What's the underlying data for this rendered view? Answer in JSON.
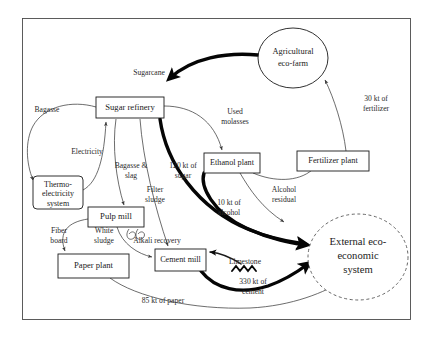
{
  "figure": {
    "type": "process-flow-diagram",
    "frame": {
      "x": 22,
      "y": 18,
      "width": 389,
      "height": 302
    }
  },
  "colors": {
    "background": "#ffffff",
    "node_stroke": "#1a1a1a",
    "thin_flow": "#3c3c3c",
    "thick_flow": "#050505",
    "dashed_stroke": "#555555",
    "text": "#1a1a1a"
  },
  "nodes": [
    {
      "id": "sugar-refinery",
      "label": "Sugar refinery",
      "shape": "rect",
      "x": 96,
      "y": 97,
      "width": 68,
      "height": 21,
      "font_size": 8.6
    },
    {
      "id": "agricultural-eco-farm",
      "label_lines": [
        "Agricultural",
        "eco-farm"
      ],
      "shape": "ellipse",
      "cx": 293,
      "cy": 58,
      "rx": 35,
      "ry": 30,
      "font_size": 8.4
    },
    {
      "id": "ethanol-plant",
      "label": "Ethanol plant",
      "shape": "rect",
      "x": 204,
      "y": 153,
      "width": 56,
      "height": 20,
      "font_size": 8.2
    },
    {
      "id": "fertilizer-plant",
      "label": "Fertilizer plant",
      "shape": "rect",
      "x": 297,
      "y": 151,
      "width": 72,
      "height": 20,
      "font_size": 8.4
    },
    {
      "id": "thermo-electricity-system",
      "label_lines": [
        "Thermo-",
        "electricity",
        "system"
      ],
      "shape": "rounded-rect",
      "x": 33,
      "y": 176,
      "width": 50,
      "height": 33,
      "font_size": 8.0
    },
    {
      "id": "pulp-mill",
      "label": "Pulp mill",
      "shape": "rect",
      "x": 88,
      "y": 207,
      "width": 56,
      "height": 20,
      "font_size": 8.6
    },
    {
      "id": "paper-plant",
      "label": "Paper plant",
      "shape": "rect",
      "x": 58,
      "y": 254,
      "width": 71,
      "height": 24,
      "font_size": 8.6
    },
    {
      "id": "cement-mill",
      "label": "Cement mill",
      "shape": "rect",
      "x": 155,
      "y": 249,
      "width": 51,
      "height": 22,
      "font_size": 8.2
    },
    {
      "id": "external-eco-economic-system",
      "label_lines": [
        "External eco-",
        "economic",
        "system"
      ],
      "shape": "ellipse-dashed",
      "cx": 358,
      "cy": 257,
      "rx": 50,
      "ry": 43,
      "font_size": 10.6
    }
  ],
  "flows": [
    {
      "id": "sugarcane",
      "label": "Sugarcane",
      "from": "agricultural-eco-farm",
      "to": "sugar-refinery",
      "weight": "thick",
      "label_x": 149,
      "label_y": 73
    },
    {
      "id": "bagasse",
      "label": "Bagasse",
      "from": "sugar-refinery",
      "to": "thermo-electricity-system",
      "weight": "thin",
      "label_x": 47,
      "label_y": 110
    },
    {
      "id": "electricity",
      "label": "Electricity",
      "from": "thermo-electricity-system",
      "to": "sugar-refinery",
      "weight": "thin",
      "label_x": 87,
      "label_y": 152
    },
    {
      "id": "bagasse-slag",
      "label_lines": [
        "Bagasse &",
        "slag"
      ],
      "from": "sugar-refinery",
      "to": "pulp-mill",
      "weight": "thin",
      "label_x": 131,
      "label_y": 170
    },
    {
      "id": "used-molasses",
      "label_lines": [
        "Used",
        "molasses"
      ],
      "from": "sugar-refinery",
      "to": "ethanol-plant",
      "weight": "thin",
      "label_x": 235,
      "label_y": 117
    },
    {
      "id": "sugar-output",
      "label_lines": [
        "120 kt of",
        "sugar"
      ],
      "from": "sugar-refinery",
      "to": "external-eco-economic-system",
      "weight": "thick",
      "label_x": 183,
      "label_y": 170
    },
    {
      "id": "filter-sludge",
      "label_lines": [
        "Filter",
        "sludge"
      ],
      "from": "sugar-refinery",
      "to": "cement-mill",
      "weight": "thin",
      "label_x": 155,
      "label_y": 194
    },
    {
      "id": "alcohol-output",
      "label_lines": [
        "10 kt of",
        "alcohol"
      ],
      "from": "ethanol-plant",
      "to": "external-eco-economic-system",
      "weight": "thick",
      "label_x": 229,
      "label_y": 207
    },
    {
      "id": "alcohol-residual",
      "label_lines": [
        "Alcohol",
        "residual"
      ],
      "from": "ethanol-plant",
      "to": "fertilizer-plant",
      "weight": "thin",
      "label_x": 284,
      "label_y": 194
    },
    {
      "id": "fertilizer-output",
      "label_lines": [
        "30 kt of",
        "fertilizer"
      ],
      "from": "fertilizer-plant",
      "to": "agricultural-eco-farm",
      "weight": "thin",
      "label_x": 376,
      "label_y": 103
    },
    {
      "id": "fiber-board",
      "label_lines": [
        "Fiber",
        "board"
      ],
      "from": "pulp-mill",
      "to": "paper-plant",
      "weight": "thin",
      "label_x": 59,
      "label_y": 235
    },
    {
      "id": "white-sludge",
      "label_lines": [
        "White",
        "sludge"
      ],
      "from": "pulp-mill",
      "to": "cement-mill",
      "weight": "thin",
      "label_x": 104,
      "label_y": 235
    },
    {
      "id": "alkali-recovery",
      "label": "Alkali recovery",
      "from": "pulp-mill",
      "to": "pulp-mill",
      "weight": "thin",
      "label_x": 156,
      "label_y": 240
    },
    {
      "id": "limestone",
      "label": "Limestone",
      "from": "external-input",
      "to": "cement-mill",
      "weight": "med",
      "label_x": 245,
      "label_y": 262
    },
    {
      "id": "cement-output",
      "label_lines": [
        "330 kt of",
        "cement"
      ],
      "from": "cement-mill",
      "to": "external-eco-economic-system",
      "weight": "thick",
      "label_x": 253,
      "label_y": 286
    },
    {
      "id": "paper-output",
      "label": "85 kt of paper",
      "from": "paper-plant",
      "to": "external-eco-economic-system",
      "weight": "thin",
      "label_x": 163,
      "label_y": 301
    }
  ]
}
